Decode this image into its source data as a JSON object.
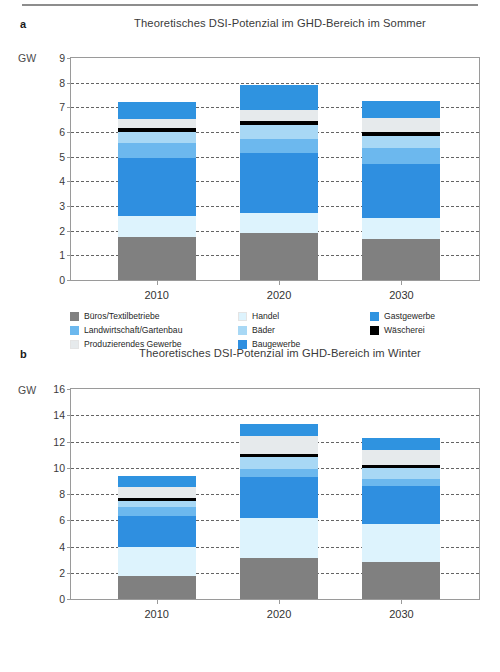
{
  "figure": {
    "unit_label": "GW",
    "rule": "header-rule"
  },
  "panels": [
    {
      "letter": "a",
      "title": "Theoretisches DSI-Potenzial im GHD-Bereich im Sommer",
      "unit": "GW"
    },
    {
      "letter": "b",
      "title": "Theoretisches DSI-Potenzial im GHD-Bereich im Winter",
      "unit": "GW"
    }
  ],
  "legend": {
    "entries": [
      {
        "label": "Büros/Textilbetriebe",
        "color": "#808080"
      },
      {
        "label": "Handel",
        "color": "#ddf3fd"
      },
      {
        "label": "Gastgewerbe",
        "color": "#2f93e0"
      },
      {
        "label": "Landwirtschaft/Gartenbau",
        "color": "#6cb8ee"
      },
      {
        "label": "Bäder",
        "color": "#a8d8f5"
      },
      {
        "label": "Wäscherei",
        "color": "#000000"
      },
      {
        "label": "Produzierendes Gewerbe",
        "color": "#e6eaec"
      },
      {
        "label": "Baugewerbe",
        "color": "#2f8fe0"
      },
      {
        "label": "",
        "color": ""
      }
    ]
  },
  "chart_data": [
    {
      "type": "bar",
      "stacked": true,
      "panel": "a",
      "title": "Theoretisches DSI-Potenzial im GHD-Bereich im Sommer",
      "xlabel": "",
      "ylabel": "GW",
      "ylim": [
        0,
        9
      ],
      "yticks": [
        0,
        1,
        2,
        3,
        4,
        5,
        6,
        7,
        8,
        9
      ],
      "grid": true,
      "legend_position": "bottom",
      "categories": [
        "2010",
        "2020",
        "2030"
      ],
      "series": [
        {
          "name": "Büros/Textilbetriebe",
          "color": "#808080",
          "values": [
            1.75,
            1.9,
            1.65
          ]
        },
        {
          "name": "Handel",
          "color": "#ddf3fd",
          "values": [
            0.85,
            0.8,
            0.85
          ]
        },
        {
          "name": "Baugewerbe",
          "color": "#2f8fe0",
          "values": [
            2.35,
            2.45,
            2.2
          ]
        },
        {
          "name": "Landwirtschaft/Gartenbau",
          "color": "#6cb8ee",
          "values": [
            0.6,
            0.55,
            0.65
          ]
        },
        {
          "name": "Bäder",
          "color": "#a8d8f5",
          "values": [
            0.45,
            0.6,
            0.5
          ]
        },
        {
          "name": "Wäscherei",
          "color": "#000000",
          "values": [
            0.15,
            0.15,
            0.15
          ]
        },
        {
          "name": "Produzierendes Gewerbe",
          "color": "#e6eaec",
          "values": [
            0.4,
            0.45,
            0.55
          ]
        },
        {
          "name": "Gastgewerbe",
          "color": "#2f93e0",
          "values": [
            0.65,
            1.0,
            0.7
          ]
        }
      ],
      "totals": [
        7.2,
        7.9,
        7.25
      ]
    },
    {
      "type": "bar",
      "stacked": true,
      "panel": "b",
      "title": "Theoretisches DSI-Potenzial im GHD-Bereich im Winter",
      "xlabel": "",
      "ylabel": "GW",
      "ylim": [
        0,
        16
      ],
      "yticks": [
        0,
        2,
        4,
        6,
        8,
        10,
        12,
        14,
        16
      ],
      "grid": true,
      "legend_position": "bottom",
      "categories": [
        "2010",
        "2020",
        "2030"
      ],
      "series": [
        {
          "name": "Büros/Textilbetriebe",
          "color": "#808080",
          "values": [
            1.75,
            3.1,
            2.85
          ]
        },
        {
          "name": "Handel",
          "color": "#ddf3fd",
          "values": [
            2.25,
            3.05,
            2.85
          ]
        },
        {
          "name": "Baugewerbe",
          "color": "#2f8fe0",
          "values": [
            2.35,
            3.15,
            2.9
          ]
        },
        {
          "name": "Landwirtschaft/Gartenbau",
          "color": "#6cb8ee",
          "values": [
            0.65,
            0.6,
            0.55
          ]
        },
        {
          "name": "Bäder",
          "color": "#a8d8f5",
          "values": [
            0.5,
            0.9,
            0.85
          ]
        },
        {
          "name": "Wäscherei",
          "color": "#000000",
          "values": [
            0.2,
            0.25,
            0.2
          ]
        },
        {
          "name": "Produzierendes Gewerbe",
          "color": "#e6eaec",
          "values": [
            0.85,
            1.35,
            1.15
          ]
        },
        {
          "name": "Gastgewerbe",
          "color": "#2f93e0",
          "values": [
            0.85,
            0.95,
            0.9
          ]
        }
      ],
      "totals": [
        9.4,
        13.35,
        12.25
      ]
    }
  ]
}
